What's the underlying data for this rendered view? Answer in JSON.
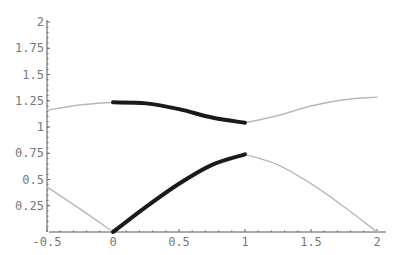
{
  "chart_data": {
    "type": "line",
    "title": "",
    "xlabel": "",
    "ylabel": "",
    "xlim": [
      -0.5,
      2.05
    ],
    "ylim": [
      0,
      2
    ],
    "grid": false,
    "legend": null,
    "x_ticks": [
      -0.5,
      0,
      0.5,
      1,
      1.5,
      2
    ],
    "x_tick_labels": [
      "-0.5",
      "0",
      "0.5",
      "1",
      "1.5",
      "2"
    ],
    "y_ticks": [
      0.25,
      0.5,
      0.75,
      1,
      1.25,
      1.5,
      1.75,
      2
    ],
    "y_tick_labels": [
      "0.25",
      "0.5",
      "0.75",
      "1",
      "1.25",
      "1.5",
      "1.75",
      "2"
    ],
    "series": [
      {
        "name": "lower band (extended, left)",
        "style": "thin-gray",
        "color": "#b8b8b8",
        "x": [
          -0.5,
          -0.25,
          0
        ],
        "y": [
          0.43,
          0.22,
          0
        ]
      },
      {
        "name": "lower band (reduced zone)",
        "style": "thick-black",
        "color": "#1a1a1a",
        "x": [
          0,
          0.25,
          0.5,
          0.75,
          1
        ],
        "y": [
          0,
          0.24,
          0.46,
          0.64,
          0.74
        ]
      },
      {
        "name": "lower band (extended, right)",
        "style": "thin-gray",
        "color": "#b8b8b8",
        "x": [
          1,
          1.25,
          1.5,
          1.75,
          2
        ],
        "y": [
          0.74,
          0.64,
          0.46,
          0.24,
          0
        ]
      },
      {
        "name": "upper band (extended, left)",
        "style": "thin-gray",
        "color": "#b8b8b8",
        "x": [
          -0.5,
          -0.25,
          0
        ],
        "y": [
          1.16,
          1.21,
          1.235
        ]
      },
      {
        "name": "upper band (reduced zone)",
        "style": "thick-black",
        "color": "#1a1a1a",
        "x": [
          0,
          0.25,
          0.5,
          0.75,
          1
        ],
        "y": [
          1.235,
          1.225,
          1.17,
          1.09,
          1.04
        ]
      },
      {
        "name": "upper band (extended, right)",
        "style": "thin-gray",
        "color": "#b8b8b8",
        "x": [
          1,
          1.25,
          1.5,
          1.75,
          2
        ],
        "y": [
          1.04,
          1.11,
          1.2,
          1.26,
          1.285
        ]
      }
    ]
  },
  "plot": {
    "origin_px": {
      "x": 113,
      "y": 232
    },
    "px_per_unit": {
      "x": 132,
      "y": 105
    },
    "x_axis_extent_px": [
      49,
      386
    ],
    "y_axis_extent_px": [
      20,
      232
    ]
  }
}
